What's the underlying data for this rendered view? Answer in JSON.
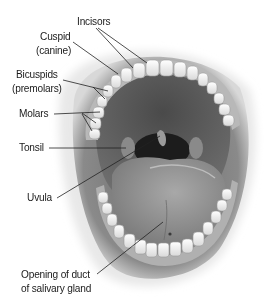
{
  "diagram": {
    "labels": {
      "incisors": "Incisors",
      "cuspid_line1": "Cuspid",
      "cuspid_line2": "(canine)",
      "bicuspids_line1": "Bicuspids",
      "bicuspids_line2": "(premolars)",
      "molars": "Molars",
      "tonsil": "Tonsil",
      "uvula": "Uvula",
      "duct_line1": "Opening of duct",
      "duct_line2": "of salivary gland"
    },
    "colors": {
      "background": "#ffffff",
      "text": "#1a1a1a",
      "leader_line": "#222222",
      "lips": "#7a7a7a",
      "palate": "#5e5e5e",
      "throat": "#1e1e1e",
      "tongue": "#8c8c8c",
      "teeth": "#f2f2f2",
      "gums": "#b5b5b5"
    }
  }
}
